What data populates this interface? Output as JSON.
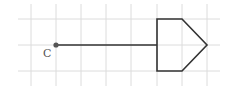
{
  "diagram": {
    "grid": {
      "color": "#dcdcdc",
      "x_lines": [
        31,
        56,
        81,
        106,
        131,
        157,
        182,
        207
      ],
      "y_lines": [
        19,
        45,
        71
      ],
      "x_extent": [
        18,
        220
      ],
      "y_extent": [
        4,
        86
      ]
    },
    "point": {
      "label": "C",
      "x": 56,
      "y": 45,
      "color": "#555555"
    },
    "segment": {
      "from": [
        56,
        45
      ],
      "to": [
        157,
        45
      ],
      "color": "#333333"
    },
    "pentagon": {
      "points": [
        [
          157,
          19
        ],
        [
          182,
          19
        ],
        [
          207,
          45
        ],
        [
          182,
          71
        ],
        [
          157,
          71
        ]
      ],
      "stroke": "#333333"
    }
  }
}
